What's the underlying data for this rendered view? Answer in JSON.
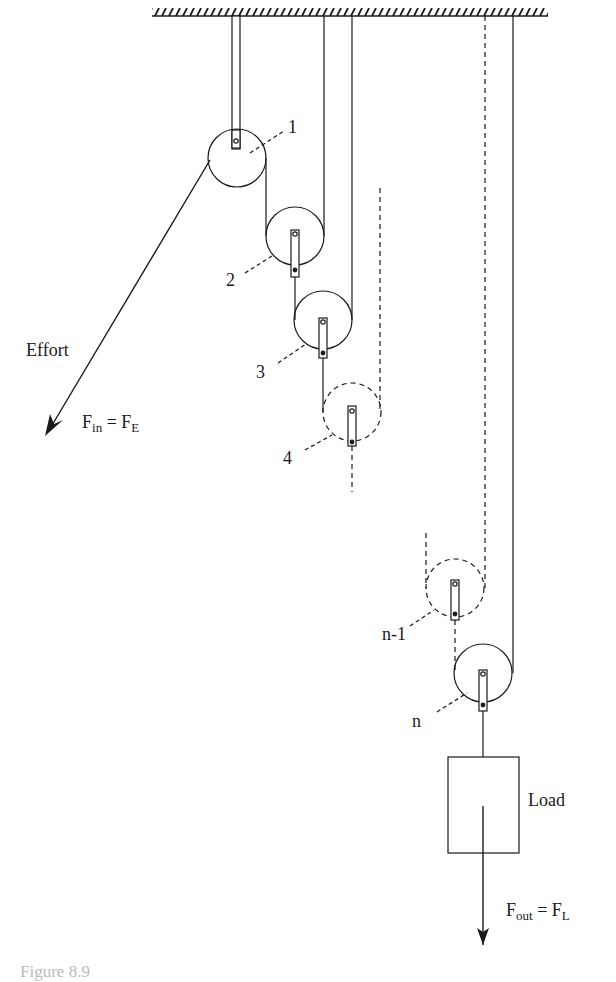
{
  "figure": {
    "type": "compound pulley system (n pulleys)",
    "ceiling": "fixed support (hatched)",
    "pulley_labels": [
      "1",
      "2",
      "3",
      "4",
      "n-1",
      "n"
    ],
    "effort_label": "Effort",
    "effort_force": {
      "main": "F",
      "sub": "in",
      "eq": " = ",
      "main2": "F",
      "sub2": "E"
    },
    "load_label": "Load",
    "load_force": {
      "main": "F",
      "sub": "out",
      "eq": " = ",
      "main2": "F",
      "sub2": "L"
    },
    "colors": {
      "line": "#1a1a1a",
      "background": "#ffffff"
    }
  },
  "caption": "Figure 8.9"
}
